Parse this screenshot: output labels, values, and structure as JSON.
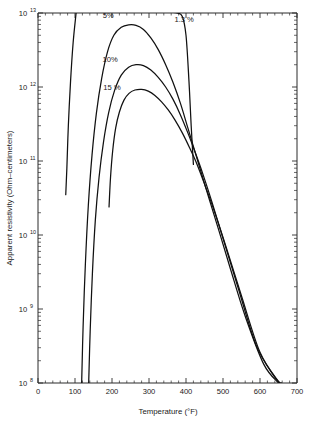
{
  "chart_data": {
    "type": "line",
    "title": "",
    "xlabel": "Temperature (°F)",
    "ylabel": "Apparent resistivity (Ohm–centimeters)",
    "xlim": [
      0,
      700
    ],
    "ylim": [
      100000000.0,
      10000000000000.0
    ],
    "yscale": "log",
    "xscale": "linear",
    "grid": false,
    "legend_position": "inline-curve-labels",
    "xticks": [
      0,
      100,
      200,
      300,
      400,
      500,
      600,
      700
    ],
    "xtick_labels": [
      "0",
      "100",
      "200",
      "300",
      "400",
      "500",
      "600",
      "700"
    ],
    "yticks": [
      100000000.0,
      1000000000.0,
      10000000000.0,
      100000000000.0,
      1000000000000.0,
      10000000000000.0
    ],
    "ytick_labels": [
      "10⁸",
      "10⁹",
      "10¹⁰",
      "10¹¹",
      "10¹²",
      "10¹³"
    ],
    "ytick_mantissas": [
      "8",
      "9",
      "10",
      "11",
      "12",
      "13"
    ],
    "ytick_base": "10",
    "series": [
      {
        "name": "1.3 %",
        "label": "1.3 %",
        "label_x": 395,
        "label_y": 7500000000000.0,
        "x": [
          75,
          78,
          82,
          88,
          95,
          103,
          110,
          118,
          128,
          140,
          155,
          175,
          200,
          230,
          260,
          290,
          320,
          350,
          375,
          390,
          400,
          408,
          414,
          420
        ],
        "y": [
          35000000000.0,
          80000000000.0,
          300000000000.0,
          1200000000000.0,
          4000000000000.0,
          10000000000000.0,
          20000000000000.0,
          30000000000000.0,
          36000000000000.0,
          38000000000000.0,
          37000000000000.0,
          34000000000000.0,
          30000000000000.0,
          25000000000000.0,
          20000000000000.0,
          16000000000000.0,
          13000000000000.0,
          10500000000000.0,
          10000000000000.0,
          9000000000000.0,
          5000000000000.0,
          1200000000000.0,
          300000000000.0,
          90000000000.0
        ]
      },
      {
        "name": "5 %",
        "label": "5%",
        "label_x": 190,
        "label_y": 8500000000000.0,
        "x": [
          118,
          122,
          128,
          136,
          146,
          158,
          172,
          188,
          205,
          225,
          245,
          265,
          285,
          305,
          325,
          345,
          365,
          385,
          405,
          425,
          445,
          465,
          490,
          520,
          560,
          610,
          650
        ],
        "y": [
          100000000.0,
          600000000.0,
          4000000000.0,
          25000000000.0,
          120000000000.0,
          450000000000.0,
          1300000000000.0,
          3000000000000.0,
          5000000000000.0,
          6400000000000.0,
          6900000000000.0,
          6800000000000.0,
          6000000000000.0,
          4600000000000.0,
          3200000000000.0,
          2000000000000.0,
          1150000000000.0,
          600000000000.0,
          280000000000.0,
          130000000000.0,
          60000000000.0,
          28000000000.0,
          11000000000.0,
          3500000000.0,
          800000000.0,
          180000000.0,
          100000000.0
        ]
      },
      {
        "name": "10 %",
        "label": "10%",
        "label_x": 195,
        "label_y": 2200000000000.0,
        "x": [
          137,
          141,
          147,
          155,
          165,
          177,
          191,
          207,
          225,
          245,
          265,
          285,
          305,
          325,
          345,
          365,
          385,
          405,
          425,
          445,
          470,
          500,
          540,
          590,
          640,
          655
        ],
        "y": [
          100000000.0,
          500000000.0,
          3000000000.0,
          16000000000.0,
          60000000000.0,
          180000000000.0,
          450000000000.0,
          900000000000.0,
          1450000000000.0,
          1850000000000.0,
          2000000000000.0,
          1950000000000.0,
          1700000000000.0,
          1350000000000.0,
          1000000000000.0,
          680000000000.0,
          420000000000.0,
          240000000000.0,
          130000000000.0,
          68000000000.0,
          28000000000.0,
          9000000000.0,
          2000000000.0,
          320000000.0,
          120000000.0,
          100000000.0
        ]
      },
      {
        "name": "15 %",
        "label": "15 %",
        "label_x": 200,
        "label_y": 900000000000.0,
        "x": [
          192,
          196,
          202,
          210,
          220,
          232,
          246,
          262,
          280,
          298,
          316,
          334,
          352,
          370,
          390,
          410,
          430,
          452,
          478,
          510,
          550,
          600,
          650,
          658
        ],
        "y": [
          24000000000.0,
          60000000000.0,
          140000000000.0,
          280000000000.0,
          460000000000.0,
          660000000000.0,
          820000000000.0,
          910000000000.0,
          930000000000.0,
          880000000000.0,
          770000000000.0,
          630000000000.0,
          490000000000.0,
          360000000000.0,
          240000000000.0,
          150000000000.0,
          90000000000.0,
          46000000000.0,
          20000000000.0,
          6500000000.0,
          1500000000.0,
          260000000.0,
          105000000.0,
          100000000.0
        ]
      }
    ],
    "annotations": [
      {
        "text": "1.3 %",
        "series": "1.3 %"
      },
      {
        "text": "5%",
        "series": "5 %"
      },
      {
        "text": "10%",
        "series": "10 %"
      },
      {
        "text": "15 %",
        "series": "15 %"
      }
    ]
  }
}
